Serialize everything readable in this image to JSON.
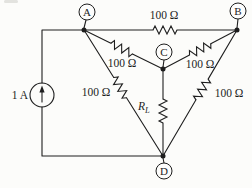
{
  "circuit": {
    "source": {
      "label": "1 A"
    },
    "nodes": {
      "a": "A",
      "b": "B",
      "c": "C",
      "d": "D"
    },
    "resistors": {
      "ab": "100 Ω",
      "ac": "100 Ω",
      "cb": "100 Ω",
      "ad": "100 Ω",
      "bd": "100 Ω"
    },
    "load": {
      "symbol": "R",
      "subscript": "L"
    }
  },
  "colors": {
    "line": "#1e1e1e",
    "background": "#fcfcfa"
  }
}
